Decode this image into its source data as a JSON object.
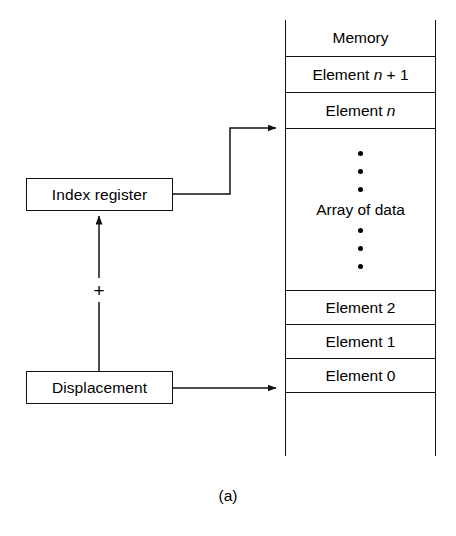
{
  "figure": {
    "caption": "(a)",
    "operator": "+"
  },
  "nodes": {
    "index_register": "Index register",
    "displacement": "Displacement"
  },
  "memory": {
    "header": "Memory",
    "rows": [
      {
        "prefix": "Element ",
        "var": "n",
        "suffix": " + 1",
        "full": "Element n + 1"
      },
      {
        "prefix": "Element ",
        "var": "n",
        "suffix": "",
        "full": "Element n"
      },
      {
        "prefix": "",
        "var": "",
        "suffix": "",
        "full": "Array of data"
      },
      {
        "prefix": "Element 2",
        "var": "",
        "suffix": "",
        "full": "Element 2"
      },
      {
        "prefix": "Element 1",
        "var": "",
        "suffix": "",
        "full": "Element 1"
      },
      {
        "prefix": "Element 0",
        "var": "",
        "suffix": "",
        "full": "Element 0"
      }
    ],
    "array_label": "Array of data",
    "dots_above": 3,
    "dots_below": 3
  },
  "labels": {
    "element_n_plus_1_prefix": "Element ",
    "element_n_plus_1_var": "n",
    "element_n_plus_1_suffix": " + 1",
    "element_n_prefix": "Element ",
    "element_n_var": "n",
    "element_2": "Element 2",
    "element_1": "Element 1",
    "element_0": "Element 0"
  },
  "colors": {
    "line": "#111111",
    "background": "#ffffff",
    "text": "#000000"
  }
}
